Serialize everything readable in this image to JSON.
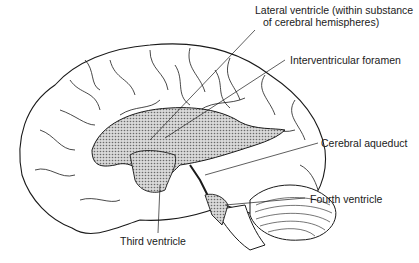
{
  "figure": {
    "labels": [
      {
        "id": "lateral",
        "line1": "Lateral ventricle (within substance",
        "line2": "of cerebral hemispheres)"
      },
      {
        "id": "interventricular",
        "text": "Interventricular foramen"
      },
      {
        "id": "aqueduct",
        "text": "Cerebral aqueduct"
      },
      {
        "id": "fourth",
        "text": "Fourth ventricle"
      },
      {
        "id": "third",
        "text": "Third ventricle"
      }
    ],
    "colors": {
      "line": "#1a1a1a",
      "fill": "#b8b8b8",
      "background": "#ffffff"
    }
  }
}
